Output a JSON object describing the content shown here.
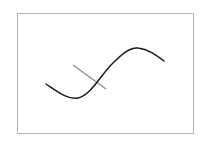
{
  "figure": {
    "frame": {
      "x": 17,
      "y": 13,
      "width": 176,
      "height": 120,
      "stroke": "#b4b4b4"
    },
    "curve": {
      "label": "s-curve",
      "color": "#1a1a1a",
      "path": "M46,84 C58,92 68,100 78,98 C90,96 100,76 112,64 C122,54 130,47 138,48 C148,49 156,55 164,61"
    },
    "line": {
      "label": "normal-line",
      "color": "#8a8a8a",
      "x1": 73,
      "y1": 65,
      "x2": 106,
      "y2": 89
    }
  }
}
